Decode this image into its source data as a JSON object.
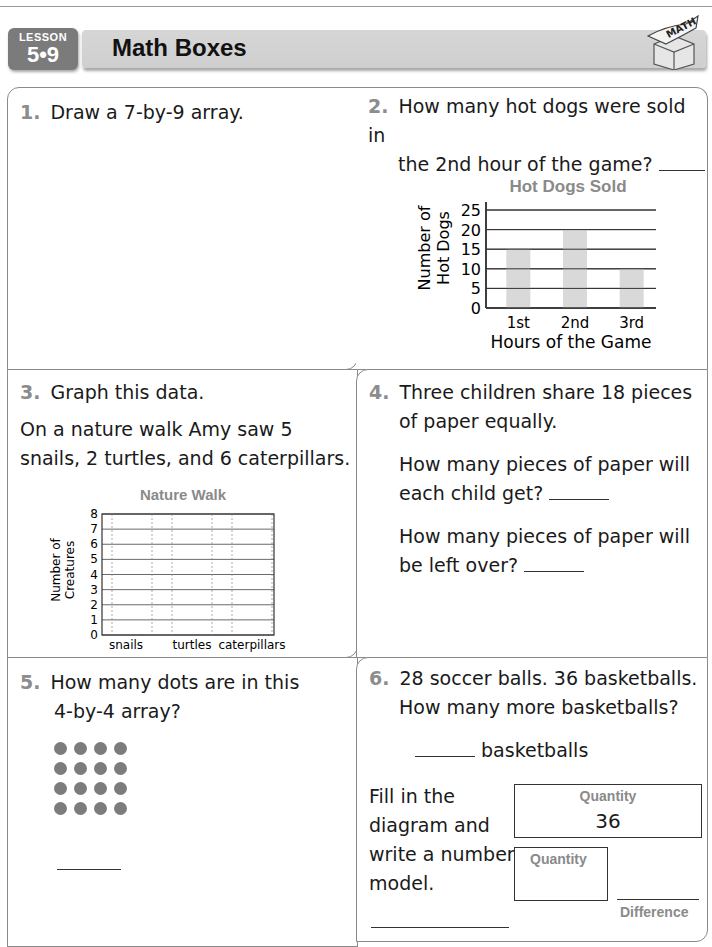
{
  "header": {
    "lesson_word": "LESSON",
    "lesson_number": "5•9",
    "title": "Math Boxes",
    "logo_text": "MATH"
  },
  "boxes": {
    "q1": {
      "number": "1.",
      "text": "Draw a 7-by-9 array."
    },
    "q2": {
      "number": "2.",
      "line1": "How many hot dogs were sold in",
      "line2": "the 2nd hour of the game?"
    },
    "q3": {
      "number": "3.",
      "text": "Graph this data.",
      "line1": "On a nature walk Amy saw 5",
      "line2": "snails, 2 turtles, and 6 caterpillars."
    },
    "q4": {
      "number": "4.",
      "line1": "Three children share 18 pieces",
      "line2": "of paper equally.",
      "sub1_line1": "How many pieces of paper will",
      "sub1_line2": "each child get?",
      "sub2_line1": "How many pieces of paper will",
      "sub2_line2": "be left over?"
    },
    "q5": {
      "number": "5.",
      "line1": "How many dots are in this",
      "line2": "4-by-4 array?",
      "rows": 4,
      "cols": 4
    },
    "q6": {
      "number": "6.",
      "line1": "28 soccer balls. 36 basketballs.",
      "line2": "How many more basketballs?",
      "answer_unit": "basketballs",
      "instr1": "Fill in the",
      "instr2": "diagram and",
      "instr3": "write a number",
      "instr4": "model.",
      "quantity_label_1": "Quantity",
      "quantity_value_1": "36",
      "quantity_label_2": "Quantity",
      "difference_label": "Difference"
    }
  },
  "chart_data": [
    {
      "type": "bar",
      "title": "Hot Dogs Sold",
      "categories": [
        "1st",
        "2nd",
        "3rd"
      ],
      "values": [
        15,
        20,
        10
      ],
      "xlabel": "Hours of the Game",
      "ylabel_line1": "Number of",
      "ylabel_line2": "Hot Dogs",
      "ylim": [
        0,
        25
      ],
      "yticks": [
        0,
        5,
        10,
        15,
        20,
        25
      ],
      "grid": true,
      "bar_color": "#d9d9d9"
    },
    {
      "type": "bar",
      "title": "Nature Walk",
      "categories": [
        "snails",
        "turtles",
        "caterpillars"
      ],
      "values": [],
      "xlabel": "",
      "ylabel_line1": "Number of",
      "ylabel_line2": "Creatures",
      "ylim": [
        0,
        8
      ],
      "yticks": [
        0,
        1,
        2,
        3,
        4,
        5,
        6,
        7,
        8
      ],
      "grid": true
    }
  ]
}
